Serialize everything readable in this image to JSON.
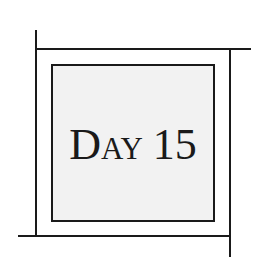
{
  "frame": {
    "title_word": "Day",
    "title_number": "15",
    "colors": {
      "line": "#1a1a1a",
      "box_fill": "#f2f2f2",
      "background": "#ffffff",
      "text": "#1a1a1a"
    }
  }
}
